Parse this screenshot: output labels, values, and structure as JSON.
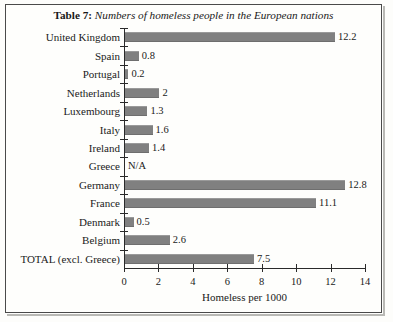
{
  "title": {
    "prefix": "Table 7:",
    "name": "Numbers of homeless people in the European nations"
  },
  "chart_data": {
    "type": "bar",
    "orientation": "horizontal",
    "title": "Table 7: Numbers of homeless people in the European nations",
    "xlabel": "Homeless per 1000",
    "ylabel": "",
    "xlim": [
      0,
      14
    ],
    "xticks": [
      0,
      2,
      4,
      6,
      8,
      10,
      12,
      14
    ],
    "grid": false,
    "legend": "none",
    "bar_color": "#808080",
    "categories": [
      "United Kingdom",
      "Spain",
      "Portugal",
      "Netherlands",
      "Luxembourg",
      "Italy",
      "Ireland",
      "Greece",
      "Germany",
      "France",
      "Denmark",
      "Belgium",
      "TOTAL (excl. Greece)"
    ],
    "values": [
      12.2,
      0.8,
      0.2,
      2,
      1.3,
      1.6,
      1.4,
      null,
      12.8,
      11.1,
      0.5,
      2.6,
      7.5
    ],
    "value_labels": [
      "12.2",
      "0.8",
      "0.2",
      "2",
      "1.3",
      "1.6",
      "1.4",
      "N/A",
      "12.8",
      "11.1",
      "0.5",
      "2.6",
      "7.5"
    ]
  }
}
